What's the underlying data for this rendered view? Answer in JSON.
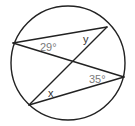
{
  "diagram": {
    "type": "circle-inscribed-angles",
    "circle": {
      "cx": 68,
      "cy": 63,
      "r": 57
    },
    "points": {
      "A": {
        "x": 13,
        "y": 43
      },
      "B": {
        "x": 107,
        "y": 27
      },
      "C": {
        "x": 124,
        "y": 77
      },
      "D": {
        "x": 29,
        "y": 105
      }
    },
    "chords": [
      {
        "from": "A",
        "to": "B"
      },
      {
        "from": "A",
        "to": "C"
      },
      {
        "from": "B",
        "to": "D"
      },
      {
        "from": "D",
        "to": "C"
      }
    ],
    "labels": {
      "angle_a": {
        "text": "29°",
        "x": 40,
        "y": 51
      },
      "angle_y": {
        "text": "y",
        "x": 83,
        "y": 43
      },
      "angle_c": {
        "text": "35°",
        "x": 89,
        "y": 83
      },
      "angle_x": {
        "text": "x",
        "x": 48,
        "y": 97
      }
    },
    "colors": {
      "stroke": "#222222",
      "angle_label": "#7a7a7a",
      "variable_label": "#333333"
    }
  }
}
